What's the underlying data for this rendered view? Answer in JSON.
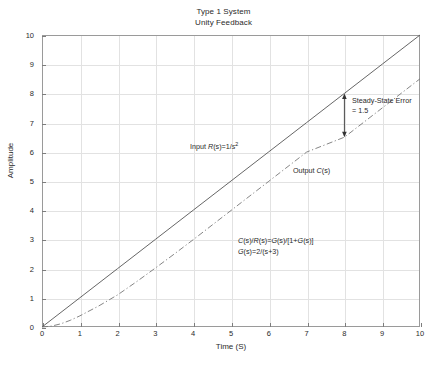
{
  "chart_data": {
    "type": "line",
    "title": "Type 1 System\nUnity Feedback",
    "title_lines": [
      "Type 1 System",
      "Unity Feedback"
    ],
    "xlabel": "Time (S)",
    "ylabel": "Amplitude",
    "xlim": [
      0,
      10
    ],
    "ylim": [
      0,
      10
    ],
    "xticks": [
      0,
      1,
      2,
      3,
      4,
      5,
      6,
      7,
      8,
      9,
      10
    ],
    "yticks": [
      0,
      1,
      2,
      3,
      4,
      5,
      6,
      7,
      8,
      9,
      10
    ],
    "grid": true,
    "legend": "none",
    "series": [
      {
        "name": "Input R(s)=1/s^2",
        "style": "solid",
        "color": "#555555",
        "x": [
          0,
          1,
          2,
          3,
          4,
          5,
          6,
          7,
          8,
          9,
          10
        ],
        "values": [
          0,
          1,
          2,
          3,
          4,
          5,
          6,
          7,
          8,
          9,
          10
        ]
      },
      {
        "name": "Output C(s)",
        "style": "dash-dot",
        "color": "#777777",
        "x": [
          0,
          0.25,
          0.5,
          0.75,
          1,
          1.5,
          2,
          2.5,
          3,
          3.5,
          4,
          5,
          6,
          7,
          8,
          9,
          10
        ],
        "values": [
          0,
          0.03,
          0.11,
          0.23,
          0.38,
          0.72,
          1.1,
          1.55,
          2.02,
          2.5,
          2.99,
          3.99,
          4.99,
          5.99,
          6.5,
          7.5,
          8.5
        ]
      }
    ],
    "annotations": [
      {
        "name": "steady-state-error",
        "text_lines": [
          "Steady-State Error",
          "= 1.5"
        ],
        "value": 1.5,
        "arrow": {
          "x": 8,
          "y_top": 8,
          "y_bottom": 6.5,
          "double_headed": true
        }
      },
      {
        "name": "input-label",
        "text": "Input R(s)=1/s²",
        "x": 4.1,
        "y": 6.6
      },
      {
        "name": "output-label",
        "text": "Output C(s)",
        "x": 7.0,
        "y": 5.35
      },
      {
        "name": "transfer-function-line1",
        "text": "C(s)/R(s)=G(s)/[1+G(s)]",
        "x": 5.2,
        "y": 2.9
      },
      {
        "name": "transfer-function-line2",
        "text": "G(s)=2/(s+3)",
        "x": 5.2,
        "y": 2.55
      }
    ]
  },
  "labels": {
    "title_line1": "Type 1 System",
    "title_line2": "Unity Feedback",
    "xaxis": "Time (S)",
    "yaxis": "Amplitude",
    "sse_line1": "Steady-State Error",
    "sse_line2": "= 1.5",
    "input_prefix": "Input ",
    "input_R": "R",
    "input_mid": "(s)=1/",
    "input_s": "s",
    "input_exp": "2",
    "output_prefix": "Output ",
    "output_C": "C",
    "output_suffix": "(s)",
    "eq1_a": "C",
    "eq1_b": "(s)/",
    "eq1_c": "R",
    "eq1_d": "(s)=",
    "eq1_e": "G",
    "eq1_f": "(s)/[1+",
    "eq1_g": "G",
    "eq1_h": "(s)]",
    "eq2_a": "G",
    "eq2_b": "(s)=2/(s+3)"
  },
  "colors": {
    "background": "#ffffff",
    "frame": "#9a9a9a",
    "grid": "#e2e2e2",
    "input_line": "#555555",
    "output_line": "#777777",
    "text": "#2a2a2a"
  }
}
